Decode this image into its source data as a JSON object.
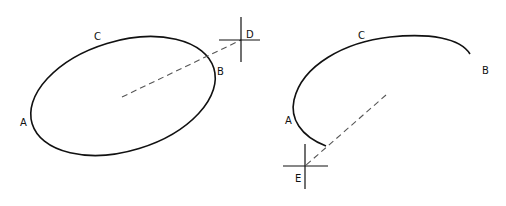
{
  "left_figure": {
    "labels": {
      "A": "A",
      "B": "B",
      "C": "C",
      "D": "D"
    },
    "description": "Ellipse with dashed line from center through B to crosshair D"
  },
  "right_figure": {
    "labels": {
      "A": "A",
      "B": "B",
      "C": "C",
      "E": "E"
    },
    "description": "Open arc A-C-B with dashed line from inside to crosshair E"
  },
  "colors": {
    "stroke": "#111111",
    "dashed": "#555555",
    "background": "#ffffff"
  }
}
